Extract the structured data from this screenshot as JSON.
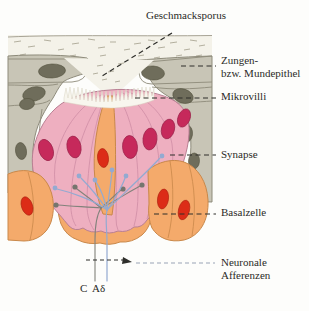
{
  "figure": {
    "labels": {
      "pore": "Geschmacksporus",
      "epithel_line1": "Zungen-",
      "epithel_line2": "bzw. Mundepithel",
      "microvilli": "Mikrovilli",
      "synapse": "Synapse",
      "basal_cell": "Basalzelle",
      "afferents_line1": "Neuronale",
      "afferents_line2": "Afferenzen",
      "fiber_c": "C",
      "fiber_adelta": "Aδ"
    },
    "colors": {
      "sensory_cell_pink": "#eeafc0",
      "support_cell_orange": "#f4aa6b",
      "epithelium_gray": "#c8c5b6",
      "epithelium_nucleus": "#6f6d5b",
      "sensory_nucleus": "#c6295b",
      "basal_nucleus_red": "#dc2c17",
      "afferent_blue": "#93aad1",
      "afferent_gray": "#82827b",
      "leader_dark": "#2e2e2a",
      "leader_light": "#99a3b6",
      "mucus": "#f4f2e9",
      "page_bg": "#fdfdfb",
      "label_text": "#2b2b27"
    }
  }
}
